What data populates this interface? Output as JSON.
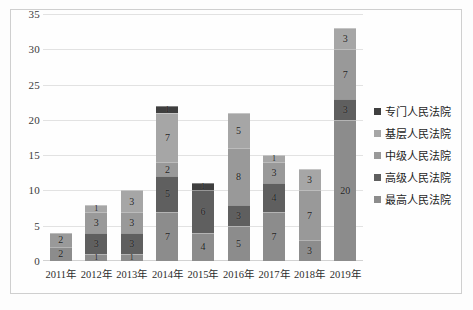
{
  "chart_data": {
    "type": "bar",
    "stacked": true,
    "title": "",
    "subtitle": "",
    "xlabel": "",
    "ylabel": "",
    "ylim": [
      0,
      35
    ],
    "ytick_step": 5,
    "yticks": [
      35,
      30,
      25,
      20,
      15,
      10,
      5,
      0
    ],
    "grid": true,
    "legend_position": "right",
    "categories": [
      "2011年",
      "2012年",
      "2013年",
      "2014年",
      "2015年",
      "2016年",
      "2017年",
      "2018年",
      "2019年"
    ],
    "series": [
      {
        "name": "最高人民法院",
        "color": "#8c8c8c",
        "values": [
          2,
          1,
          1,
          7,
          4,
          5,
          7,
          3,
          20
        ]
      },
      {
        "name": "高级人民法院",
        "color": "#5f5f5f",
        "values": [
          0,
          3,
          3,
          5,
          6,
          3,
          4,
          0,
          3
        ]
      },
      {
        "name": "中级人民法院",
        "color": "#999999",
        "values": [
          2,
          3,
          3,
          2,
          0,
          8,
          3,
          7,
          7
        ]
      },
      {
        "name": "基层人民法院",
        "color": "#a6a6a6",
        "values": [
          0,
          1,
          3,
          7,
          0,
          5,
          1,
          3,
          3
        ]
      },
      {
        "name": "专门人民法院",
        "color": "#3f3f3f",
        "values": [
          0,
          0,
          0,
          1,
          1,
          0,
          0,
          0,
          0
        ]
      }
    ],
    "legend_order": [
      "专门人民法院",
      "基层人民法院",
      "中级人民法院",
      "高级人民法院",
      "最高人民法院"
    ],
    "totals": [
      4,
      8,
      10,
      22,
      11,
      21,
      15,
      13,
      33
    ],
    "stack_order_bottom_to_top": [
      "最高人民法院",
      "高级人民法院",
      "中级人民法院",
      "基层人民法院",
      "专门人民法院"
    ]
  },
  "legend": {
    "items": [
      {
        "label": "专门人民法院",
        "color": "#3f3f3f"
      },
      {
        "label": "基层人民法院",
        "color": "#a6a6a6"
      },
      {
        "label": "中级人民法院",
        "color": "#999999"
      },
      {
        "label": "高级人民法院",
        "color": "#5f5f5f"
      },
      {
        "label": "最高人民法院",
        "color": "#8c8c8c"
      }
    ]
  }
}
